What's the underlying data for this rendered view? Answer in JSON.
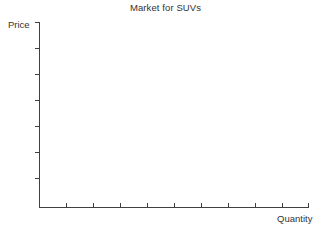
{
  "chart_data": {
    "type": "line",
    "title": "Market for SUVs",
    "xlabel": "Quantity",
    "ylabel": "Price",
    "series": [],
    "x": [],
    "values": [],
    "categories": [],
    "grid": false,
    "legend": "none",
    "xlim": [
      0,
      10
    ],
    "ylim": [
      0,
      7
    ],
    "x_tick_count": 10,
    "y_tick_count": 7,
    "x_tick_labels": [],
    "y_tick_labels": [],
    "annotations": [],
    "note": "Empty axes: no data series plotted"
  },
  "chart": {
    "title": "Market for SUVs",
    "y_axis_label": "Price",
    "x_axis_label": "Quantity",
    "axis_color": "#404040",
    "tick_color": "#404040",
    "background_color": "#ffffff",
    "text_color": "#333333"
  },
  "geometry": {
    "origin_x": 39.5,
    "origin_y": 207.5,
    "y_axis_top": 22,
    "x_axis_right": 308.5,
    "y_tick_positions": [
      22,
      48,
      74,
      100,
      126,
      152,
      178
    ],
    "x_tick_positions": [
      66,
      93,
      120,
      147,
      174,
      201,
      228,
      255,
      282,
      308.5
    ],
    "y_tick_length": 5,
    "x_tick_length": 5
  }
}
